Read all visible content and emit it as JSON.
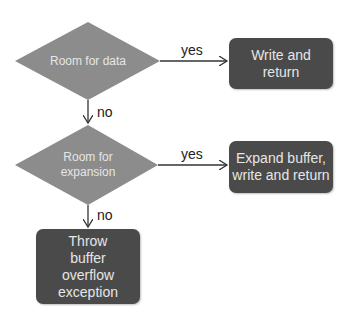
{
  "nodes": {
    "decision1": {
      "label": "Room for data"
    },
    "decision2": {
      "label": "Room for expansion"
    },
    "write": {
      "label": "Write and return"
    },
    "expand": {
      "label": "Expand buffer, write and return"
    },
    "throw": {
      "label": "Throw buffer overflow exception"
    }
  },
  "edges": {
    "d1_yes": "yes",
    "d1_no": "no",
    "d2_yes": "yes",
    "d2_no": "no"
  },
  "colors": {
    "decision_fill": "#8c8c8c",
    "box_fill": "#4a4a4a",
    "node_text": "#e6e6e6",
    "edge": "#333333"
  }
}
